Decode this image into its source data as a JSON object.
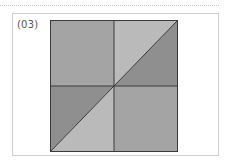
{
  "figure": {
    "label": "(03)"
  },
  "diagram": {
    "colors": {
      "quadrant_medium": "#a4a4a4",
      "triangle_light": "#bababa",
      "triangle_dark": "#8f8f8f",
      "stroke": "#3a3a3a",
      "frame_border": "#cfcfcf",
      "dotted_rule": "#c8c8c8",
      "label_text": "#555555"
    },
    "regions": [
      {
        "name": "top-left-quadrant",
        "shape": "square",
        "fill": "medium"
      },
      {
        "name": "top-right-upper-triangle",
        "shape": "triangle",
        "fill": "light"
      },
      {
        "name": "top-right-lower-triangle",
        "shape": "triangle",
        "fill": "dark"
      },
      {
        "name": "bottom-left-upper-triangle",
        "shape": "triangle",
        "fill": "dark"
      },
      {
        "name": "bottom-left-lower-triangle",
        "shape": "triangle",
        "fill": "light"
      },
      {
        "name": "bottom-right-quadrant",
        "shape": "square",
        "fill": "medium"
      }
    ]
  }
}
